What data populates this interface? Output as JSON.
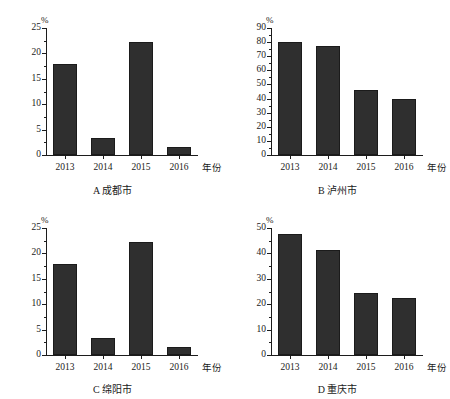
{
  "figure": {
    "panel_count": 4,
    "bar_color": "#2f2f2f",
    "axis_color": "#1c1c1c",
    "background": "#ffffff"
  },
  "panels": [
    {
      "key": "A",
      "caption": "A  成都市",
      "unit_label": "%",
      "xaxis_title": "年份",
      "categories": [
        "2013",
        "2014",
        "2015",
        "2016"
      ],
      "values": [
        18,
        3.4,
        22.2,
        1.5
      ],
      "yticks": [
        "0",
        "5",
        "10",
        "15",
        "20",
        "25"
      ],
      "ymin": 0,
      "ymax": 25
    },
    {
      "key": "B",
      "caption": "B  泸州市",
      "unit_label": "%",
      "xaxis_title": "年份",
      "categories": [
        "2013",
        "2014",
        "2015",
        "2016"
      ],
      "values": [
        80,
        77,
        46,
        40
      ],
      "yticks": [
        "0",
        "10",
        "20",
        "30",
        "40",
        "50",
        "60",
        "70",
        "80",
        "90"
      ],
      "ymin": 0,
      "ymax": 90
    },
    {
      "key": "C",
      "caption": "C  绵阳市",
      "unit_label": "%",
      "xaxis_title": "年份",
      "categories": [
        "2013",
        "2014",
        "2015",
        "2016"
      ],
      "values": [
        18,
        3.4,
        22.2,
        1.5
      ],
      "yticks": [
        "0",
        "5",
        "10",
        "15",
        "20",
        "25"
      ],
      "ymin": 0,
      "ymax": 25
    },
    {
      "key": "D",
      "caption": "D  重庆市",
      "unit_label": "%",
      "xaxis_title": "年份",
      "categories": [
        "2013",
        "2014",
        "2015",
        "2016"
      ],
      "values": [
        47.5,
        41.5,
        24.5,
        22.5
      ],
      "yticks": [
        "0",
        "10",
        "20",
        "30",
        "40",
        "50"
      ],
      "ymin": 0,
      "ymax": 50
    }
  ],
  "chart_data": [
    {
      "type": "bar",
      "title": "A  成都市",
      "categories": [
        "2013",
        "2014",
        "2015",
        "2016"
      ],
      "values": [
        18,
        3.4,
        22.2,
        1.5
      ],
      "xlabel": "年份",
      "ylabel": "%",
      "ylim": [
        0,
        25
      ],
      "ytick_step": 5,
      "grid": false,
      "legend": "none"
    },
    {
      "type": "bar",
      "title": "B  泸州市",
      "categories": [
        "2013",
        "2014",
        "2015",
        "2016"
      ],
      "values": [
        80,
        77,
        46,
        40
      ],
      "xlabel": "年份",
      "ylabel": "%",
      "ylim": [
        0,
        90
      ],
      "ytick_step": 10,
      "grid": false,
      "legend": "none"
    },
    {
      "type": "bar",
      "title": "C  绵阳市",
      "categories": [
        "2013",
        "2014",
        "2015",
        "2016"
      ],
      "values": [
        18,
        3.4,
        22.2,
        1.5
      ],
      "xlabel": "年份",
      "ylabel": "%",
      "ylim": [
        0,
        25
      ],
      "ytick_step": 5,
      "grid": false,
      "legend": "none"
    },
    {
      "type": "bar",
      "title": "D  重庆市",
      "categories": [
        "2013",
        "2014",
        "2015",
        "2016"
      ],
      "values": [
        47.5,
        41.5,
        24.5,
        22.5
      ],
      "xlabel": "年份",
      "ylabel": "%",
      "ylim": [
        0,
        50
      ],
      "ytick_step": 10,
      "grid": false,
      "legend": "none"
    }
  ]
}
